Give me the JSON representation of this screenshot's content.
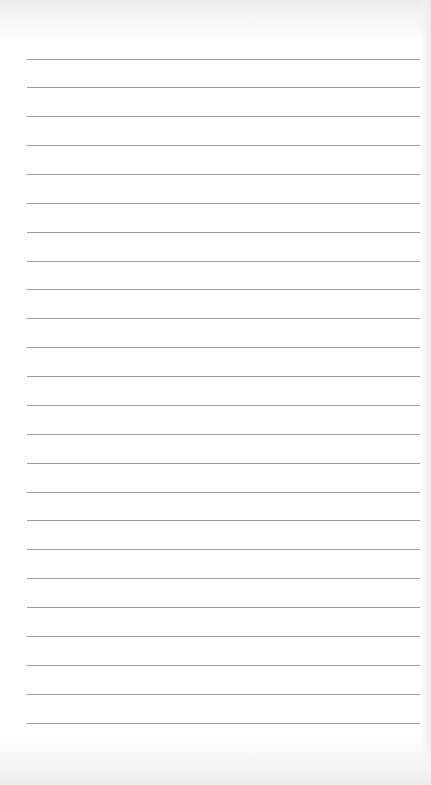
{
  "page": {
    "type": "blank-lined-notepad-sheet",
    "background_color": "#ffffff",
    "edge_shade_color": "#ececec"
  },
  "rules": {
    "count": 24,
    "left": 27,
    "right": 420,
    "first_y": 58.5,
    "spacing": 28.87,
    "color": "#9c9c9c",
    "thickness": 1
  },
  "text_content": []
}
